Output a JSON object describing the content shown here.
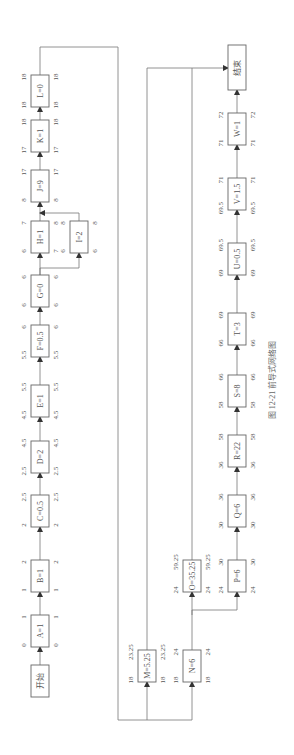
{
  "figure": {
    "caption": "图 12-21   前导式网络图",
    "start_label": "开始",
    "end_label": "结束"
  },
  "activities": [
    {
      "id": "A",
      "label": "A=1",
      "es": "0",
      "ef": "1",
      "ls": "0",
      "lf": "1"
    },
    {
      "id": "B",
      "label": "B=1",
      "es": "1",
      "ef": "2",
      "ls": "1",
      "lf": "2"
    },
    {
      "id": "C",
      "label": "C=0.5",
      "es": "2",
      "ef": "2.5",
      "ls": "2",
      "lf": "2.5"
    },
    {
      "id": "D",
      "label": "D=2",
      "es": "2.5",
      "ef": "4.5",
      "ls": "2.5",
      "lf": "4.5"
    },
    {
      "id": "E",
      "label": "E=1",
      "es": "4.5",
      "ef": "5.5",
      "ls": "4.5",
      "lf": "5.5"
    },
    {
      "id": "F",
      "label": "F=0.5",
      "es": "5.5",
      "ef": "6",
      "ls": "5.5",
      "lf": "6"
    },
    {
      "id": "G",
      "label": "G=0",
      "es": "6",
      "ef": "6",
      "ls": "6",
      "lf": "6"
    },
    {
      "id": "H",
      "label": "H=1",
      "es": "6",
      "ef": "7",
      "ls": "7",
      "lf": "8"
    },
    {
      "id": "I",
      "label": "I=2",
      "es": "6",
      "ef": "8",
      "ls": "6",
      "lf": "8"
    },
    {
      "id": "J",
      "label": "J=9",
      "es": "8",
      "ef": "17",
      "ls": "8",
      "lf": "17"
    },
    {
      "id": "K",
      "label": "K=1",
      "es": "17",
      "ef": "18",
      "ls": "17",
      "lf": "18"
    },
    {
      "id": "L",
      "label": "L=0",
      "es": "18",
      "ef": "18",
      "ls": "18",
      "lf": "18"
    },
    {
      "id": "M",
      "label": "M=5.25",
      "es": "18",
      "ef": "23.25",
      "ls": "18",
      "lf": "23.25"
    },
    {
      "id": "N",
      "label": "N=6",
      "es": "18",
      "ef": "24",
      "ls": "18",
      "lf": "24"
    },
    {
      "id": "O",
      "label": "O=35.25",
      "es": "24",
      "ef": "59.25",
      "ls": "24",
      "lf": "59.25"
    },
    {
      "id": "P",
      "label": "P=6",
      "es": "24",
      "ef": "30",
      "ls": "24",
      "lf": "30"
    },
    {
      "id": "Q",
      "label": "Q=6",
      "es": "30",
      "ef": "36",
      "ls": "30",
      "lf": "36"
    },
    {
      "id": "R",
      "label": "R=22",
      "es": "36",
      "ef": "58",
      "ls": "36",
      "lf": "58"
    },
    {
      "id": "S",
      "label": "S=8",
      "es": "58",
      "ef": "66",
      "ls": "58",
      "lf": "66"
    },
    {
      "id": "T",
      "label": "T=3",
      "es": "66",
      "ef": "69",
      "ls": "66",
      "lf": "69"
    },
    {
      "id": "U",
      "label": "U=0.5",
      "es": "69",
      "ef": "69.5",
      "ls": "69",
      "lf": "69.5"
    },
    {
      "id": "V",
      "label": "V=1.5",
      "es": "69.5",
      "ef": "71",
      "ls": "69.5",
      "lf": "71"
    },
    {
      "id": "W",
      "label": "W=1",
      "es": "71",
      "ef": "72",
      "ls": "71",
      "lf": "72"
    }
  ],
  "edges": [
    [
      "开始",
      "A"
    ],
    [
      "A",
      "B"
    ],
    [
      "B",
      "C"
    ],
    [
      "C",
      "D"
    ],
    [
      "D",
      "E"
    ],
    [
      "E",
      "F"
    ],
    [
      "F",
      "G"
    ],
    [
      "G",
      "H"
    ],
    [
      "G",
      "I"
    ],
    [
      "H",
      "J"
    ],
    [
      "I",
      "J"
    ],
    [
      "J",
      "K"
    ],
    [
      "K",
      "L"
    ],
    [
      "L",
      "M"
    ],
    [
      "L",
      "N"
    ],
    [
      "N",
      "O"
    ],
    [
      "N",
      "P"
    ],
    [
      "P",
      "Q"
    ],
    [
      "Q",
      "R"
    ],
    [
      "R",
      "S"
    ],
    [
      "S",
      "T"
    ],
    [
      "T",
      "U"
    ],
    [
      "U",
      "V"
    ],
    [
      "V",
      "W"
    ],
    [
      "W",
      "结束"
    ],
    [
      "M",
      "结束"
    ],
    [
      "O",
      "结束"
    ]
  ]
}
